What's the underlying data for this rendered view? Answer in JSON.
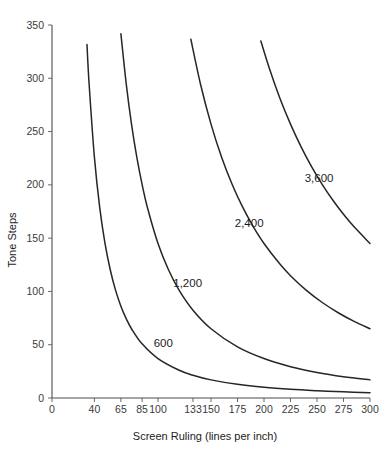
{
  "chart_data": {
    "type": "line",
    "title": "",
    "xlabel": "Screen Ruling (lines per inch)",
    "ylabel": "Tone Steps",
    "xlim": [
      0,
      300
    ],
    "ylim": [
      0,
      350
    ],
    "grid": false,
    "legend_position": "inline-labels",
    "xticks": [
      0,
      40,
      65,
      85,
      100,
      133,
      150,
      175,
      200,
      225,
      250,
      275,
      300
    ],
    "xticklabels": [
      "0",
      "40",
      "65",
      "85",
      "100",
      "133",
      "150",
      "175",
      "200",
      "225",
      "250",
      "275",
      "300"
    ],
    "yticks": [
      0,
      50,
      100,
      150,
      200,
      250,
      300,
      350
    ],
    "yticklabels": [
      "0",
      "50",
      "100",
      "150",
      "200",
      "250",
      "300",
      "350"
    ],
    "formula": "tone_steps = (dpi / lpi)^2 + 1",
    "series": [
      {
        "name": "600",
        "label": "600",
        "dpi": 600,
        "label_x": 105,
        "label_y": 48,
        "points": [
          {
            "x": 33,
            "y": 331.6
          },
          {
            "x": 35,
            "y": 294.9
          },
          {
            "x": 40,
            "y": 226.0
          },
          {
            "x": 45,
            "y": 178.8
          },
          {
            "x": 50,
            "y": 145.0
          },
          {
            "x": 55,
            "y": 120.1
          },
          {
            "x": 60,
            "y": 101.0
          },
          {
            "x": 65,
            "y": 86.2
          },
          {
            "x": 70,
            "y": 74.5
          },
          {
            "x": 75,
            "y": 65.0
          },
          {
            "x": 85,
            "y": 50.8
          },
          {
            "x": 100,
            "y": 37.0
          },
          {
            "x": 120,
            "y": 26.0
          },
          {
            "x": 133,
            "y": 21.4
          },
          {
            "x": 150,
            "y": 17.0
          },
          {
            "x": 175,
            "y": 12.8
          },
          {
            "x": 200,
            "y": 10.0
          },
          {
            "x": 225,
            "y": 8.1
          },
          {
            "x": 250,
            "y": 6.8
          },
          {
            "x": 275,
            "y": 5.8
          },
          {
            "x": 300,
            "y": 5.0
          }
        ]
      },
      {
        "name": "1,200",
        "label": "1,200",
        "dpi": 1200,
        "label_x": 128,
        "label_y": 104,
        "points": [
          {
            "x": 65,
            "y": 341.7
          },
          {
            "x": 70,
            "y": 295.0
          },
          {
            "x": 75,
            "y": 257.0
          },
          {
            "x": 80,
            "y": 226.0
          },
          {
            "x": 85,
            "y": 200.4
          },
          {
            "x": 90,
            "y": 178.8
          },
          {
            "x": 100,
            "y": 145.0
          },
          {
            "x": 110,
            "y": 120.1
          },
          {
            "x": 120,
            "y": 101.0
          },
          {
            "x": 133,
            "y": 82.4
          },
          {
            "x": 150,
            "y": 65.0
          },
          {
            "x": 175,
            "y": 48.0
          },
          {
            "x": 200,
            "y": 37.0
          },
          {
            "x": 225,
            "y": 29.4
          },
          {
            "x": 250,
            "y": 24.0
          },
          {
            "x": 275,
            "y": 20.0
          },
          {
            "x": 300,
            "y": 17.0
          }
        ]
      },
      {
        "name": "2,400",
        "label": "2,400",
        "dpi": 2400,
        "label_x": 186,
        "label_y": 160,
        "points": [
          {
            "x": 131,
            "y": 336.6
          },
          {
            "x": 140,
            "y": 294.9
          },
          {
            "x": 150,
            "y": 257.0
          },
          {
            "x": 160,
            "y": 226.0
          },
          {
            "x": 170,
            "y": 200.4
          },
          {
            "x": 180,
            "y": 178.8
          },
          {
            "x": 190,
            "y": 160.6
          },
          {
            "x": 200,
            "y": 145.0
          },
          {
            "x": 215,
            "y": 125.7
          },
          {
            "x": 225,
            "y": 114.8
          },
          {
            "x": 240,
            "y": 101.0
          },
          {
            "x": 255,
            "y": 89.6
          },
          {
            "x": 270,
            "y": 80.0
          },
          {
            "x": 285,
            "y": 71.9
          },
          {
            "x": 300,
            "y": 65.0
          }
        ]
      },
      {
        "name": "3,600",
        "label": "3,600",
        "dpi": 3600,
        "label_x": 252,
        "label_y": 203,
        "points": [
          {
            "x": 197,
            "y": 335.0
          },
          {
            "x": 205,
            "y": 309.4
          },
          {
            "x": 215,
            "y": 281.3
          },
          {
            "x": 225,
            "y": 257.0
          },
          {
            "x": 235,
            "y": 235.7
          },
          {
            "x": 245,
            "y": 216.9
          },
          {
            "x": 255,
            "y": 200.3
          },
          {
            "x": 265,
            "y": 185.6
          },
          {
            "x": 275,
            "y": 172.4
          },
          {
            "x": 285,
            "y": 160.6
          },
          {
            "x": 300,
            "y": 145.0
          }
        ]
      }
    ]
  },
  "colors": {
    "curve": "#262626",
    "axis": "#4d4d4d",
    "text": "#1c1c1c",
    "background": "#ffffff"
  }
}
